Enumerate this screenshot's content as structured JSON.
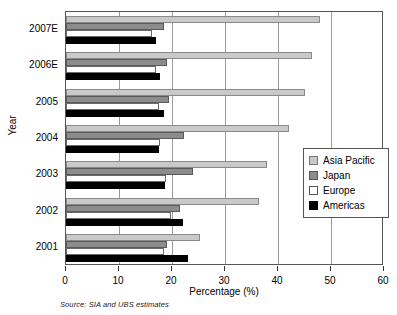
{
  "chart_data": {
    "type": "bar",
    "orientation": "horizontal",
    "title": "",
    "xlabel": "Percentage (%)",
    "ylabel": "Year",
    "xlim": [
      0,
      60
    ],
    "xticks": [
      0,
      10,
      20,
      30,
      40,
      50,
      60
    ],
    "grid": true,
    "grid_axis": "x",
    "legend_position": "right",
    "categories": [
      "2007E",
      "2006E",
      "2005",
      "2004",
      "2003",
      "2002",
      "2001"
    ],
    "series": [
      {
        "name": "Asia Pacific",
        "color": "#c9c9c9",
        "values": [
          48.0,
          46.5,
          45.0,
          42.0,
          38.0,
          36.5,
          25.3
        ]
      },
      {
        "name": "Japan",
        "color": "#8c8c8c",
        "values": [
          18.5,
          19.0,
          19.5,
          22.2,
          24.0,
          21.5,
          19.0
        ]
      },
      {
        "name": "Europe",
        "color": "#ffffff",
        "values": [
          16.2,
          17.0,
          17.5,
          17.7,
          18.8,
          19.8,
          18.5
        ]
      },
      {
        "name": "Americas",
        "color": "#000000",
        "values": [
          17.0,
          17.8,
          18.4,
          17.6,
          18.6,
          22.0,
          23.0
        ]
      }
    ],
    "source_note": "Source: SIA and UBS estimates"
  },
  "legend": {
    "items": [
      {
        "label": "Asia Pacific",
        "swatch": "asia"
      },
      {
        "label": "Japan",
        "swatch": "japan"
      },
      {
        "label": "Europe",
        "swatch": "europe"
      },
      {
        "label": "Americas",
        "swatch": "americas"
      }
    ]
  },
  "axes": {
    "x_title": "Percentage (%)",
    "y_title": "Year",
    "x_tick_labels": [
      "0",
      "10",
      "20",
      "30",
      "40",
      "50",
      "60"
    ],
    "y_tick_labels": [
      "2007E",
      "2006E",
      "2005",
      "2004",
      "2003",
      "2002",
      "2001"
    ]
  },
  "footer": {
    "source": "Source: SIA and UBS estimates"
  }
}
